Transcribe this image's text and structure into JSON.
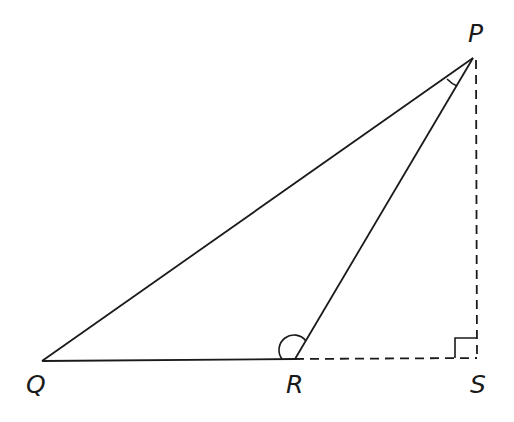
{
  "diagram": {
    "type": "geometry-triangle",
    "vertices": [
      "P",
      "Q",
      "R",
      "S"
    ],
    "labels": {
      "P": "P",
      "Q": "Q",
      "R": "R",
      "S": "S"
    },
    "solid_segments": [
      "PQ",
      "QR",
      "RP"
    ],
    "dashed_segments": [
      "RS",
      "PS"
    ],
    "angle_marks": [
      {
        "vertex": "P",
        "between": [
          "PQ",
          "PR"
        ],
        "style": "arc"
      },
      {
        "vertex": "R",
        "between": [
          "RQ",
          "RP"
        ],
        "style": "arc"
      },
      {
        "vertex": "S",
        "between": [
          "SR",
          "SP"
        ],
        "style": "right-angle"
      }
    ],
    "line_color": "#1a1a1a",
    "background": "#ffffff"
  }
}
